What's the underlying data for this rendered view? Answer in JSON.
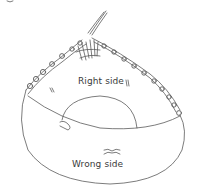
{
  "figure": {
    "labels": {
      "right_side": "Right side",
      "wrong_side": "Wrong side"
    },
    "colors": {
      "line": "#555555",
      "background": "#ffffff"
    }
  }
}
